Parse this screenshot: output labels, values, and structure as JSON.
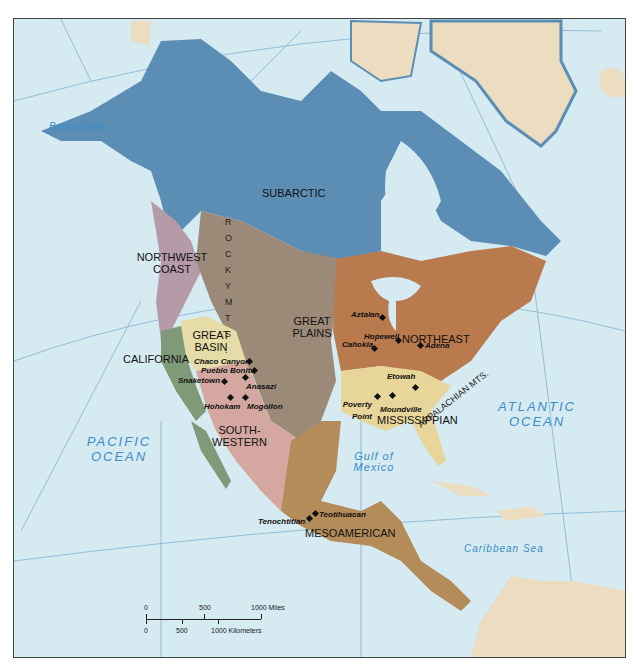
{
  "map": {
    "title": "Native American Culture Areas of North America",
    "colors": {
      "ocean": "#d6eaf2",
      "subarctic": "#5b8db5",
      "great_plains": "#9c8a78",
      "northeast": "#b97a4e",
      "mississippian": "#e8d59a",
      "great_basin": "#e6dca8",
      "california": "#7f9a78",
      "northwest_coast": "#b59aa8",
      "southwestern": "#d4a8a0",
      "mesoamerican": "#b38c5a",
      "other_land": "#ecdcc0",
      "water_label": "#3a8cc8",
      "graticule": "#7fb3d0"
    },
    "regions": [
      {
        "id": "subarctic",
        "label": "SUBARCTIC"
      },
      {
        "id": "northwest-coast",
        "label": "NORTHWEST COAST"
      },
      {
        "id": "great-plains",
        "label": "GREAT PLAINS"
      },
      {
        "id": "great-basin",
        "label": "GREAT BASIN"
      },
      {
        "id": "california",
        "label": "CALIFORNIA"
      },
      {
        "id": "northeast",
        "label": "NORTHEAST"
      },
      {
        "id": "southwestern",
        "label": "SOUTH-WESTERN"
      },
      {
        "id": "mississippian",
        "label": "MISSISSIPPIAN"
      },
      {
        "id": "mesoamerican",
        "label": "MESOAMERICAN"
      }
    ],
    "sites": [
      {
        "name": "Chaco Canyon"
      },
      {
        "name": "Pueblo Bonito"
      },
      {
        "name": "Snaketown"
      },
      {
        "name": "Anasazi"
      },
      {
        "name": "Hohokam"
      },
      {
        "name": "Mogollon"
      },
      {
        "name": "Aztalan"
      },
      {
        "name": "Hopewell"
      },
      {
        "name": "Cahokia"
      },
      {
        "name": "Adena"
      },
      {
        "name": "Etowah"
      },
      {
        "name": "Poverty Point"
      },
      {
        "name": "Moundville"
      },
      {
        "name": "Teotihuacan"
      },
      {
        "name": "Tenochtitlán"
      }
    ],
    "water_labels": {
      "bering": "Bering Strait",
      "pacific": "PACIFIC OCEAN",
      "atlantic": "ATLANTIC OCEAN",
      "gulf": "Gulf of Mexico",
      "caribbean": "Caribbean Sea"
    },
    "mountains": {
      "rocky": "R O C K Y   M T S .",
      "appalachian": "APPALACHIAN MTS."
    },
    "scale": {
      "miles": [
        "0",
        "500",
        "1000 Miles"
      ],
      "km": [
        "0",
        "500",
        "1000 Kilometers"
      ]
    }
  }
}
